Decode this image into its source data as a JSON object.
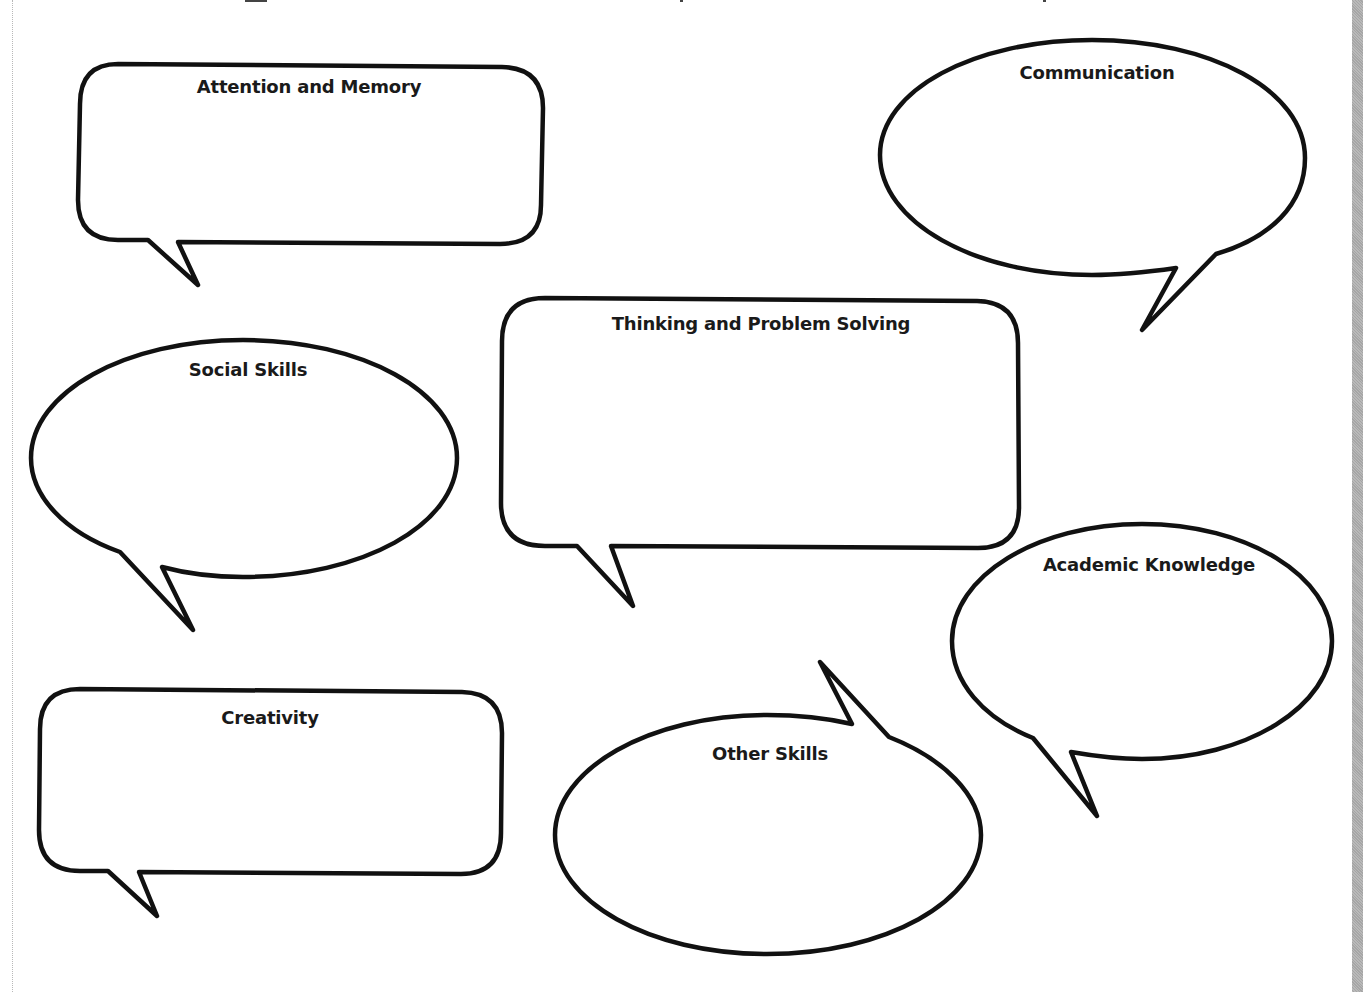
{
  "worksheet": {
    "layout": "speech-bubble graphic organizer",
    "stroke_color": "#111111",
    "background_color": "#ffffff",
    "binding_strip_color": "#b0b0b0",
    "bubbles": [
      {
        "id": "attention-memory",
        "label": "Attention and Memory",
        "shape": "rounded-rectangle",
        "tail": "bottom-left"
      },
      {
        "id": "communication",
        "label": "Communication",
        "shape": "ellipse",
        "tail": "bottom-right"
      },
      {
        "id": "social-skills",
        "label": "Social Skills",
        "shape": "ellipse",
        "tail": "bottom-left"
      },
      {
        "id": "thinking-problem-solving",
        "label": "Thinking and Problem Solving",
        "shape": "rounded-rectangle",
        "tail": "bottom-left"
      },
      {
        "id": "academic-knowledge",
        "label": "Academic Knowledge",
        "shape": "ellipse",
        "tail": "bottom-left"
      },
      {
        "id": "creativity",
        "label": "Creativity",
        "shape": "rounded-rectangle",
        "tail": "bottom-left"
      },
      {
        "id": "other-skills",
        "label": "Other Skills",
        "shape": "ellipse",
        "tail": "top-right"
      }
    ]
  }
}
